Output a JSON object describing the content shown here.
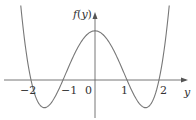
{
  "chart_data": {
    "type": "line",
    "title": "",
    "xlabel": "y",
    "ylabel": "f(y)",
    "function": "f(y) = y^4 - 5y^2 + 4 (shape)",
    "x_ticks": [
      "-2",
      "-1",
      "0",
      "1",
      "2"
    ],
    "roots": [
      -2,
      -1,
      1,
      2
    ],
    "local_max": {
      "x": 0,
      "y": 4
    },
    "local_min": [
      {
        "x": -1.58,
        "y": -2.25
      },
      {
        "x": 1.58,
        "y": -2.25
      }
    ],
    "xlim": [
      -2.6,
      2.6
    ],
    "grid": false,
    "series": [
      {
        "name": "f(y)",
        "x": [
          -2.3,
          -2,
          -1.58,
          -1,
          0,
          1,
          1.58,
          2,
          2.3
        ],
        "values": [
          5.53,
          0,
          -2.25,
          0,
          4,
          0,
          -2.25,
          0,
          5.53
        ]
      }
    ]
  },
  "labels": {
    "y_axis": "f(y)",
    "x_axis": "y",
    "tick_m2": "−2",
    "tick_m1": "−1",
    "tick_0": "0",
    "tick_1": "1",
    "tick_2": "2"
  },
  "colors": {
    "axis": "#555555",
    "curve": "#777777"
  }
}
